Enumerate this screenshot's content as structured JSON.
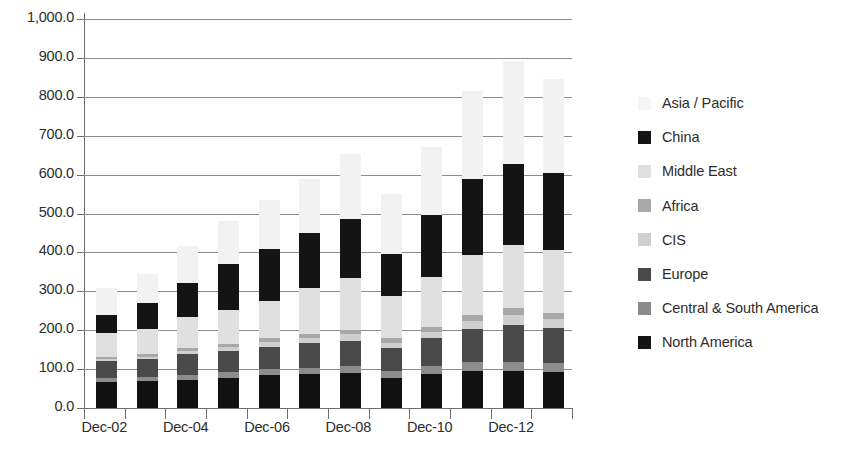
{
  "chart_data": {
    "type": "bar",
    "stacked": true,
    "title": "",
    "xlabel": "",
    "ylabel": "",
    "ylim": [
      0,
      1000
    ],
    "ytick_step": 100,
    "grid": true,
    "legend_position": "right",
    "categories": [
      "Dec-02",
      "Dec-03",
      "Dec-04",
      "Dec-05",
      "Dec-06",
      "Dec-07",
      "Dec-08",
      "Dec-09",
      "Dec-10",
      "Dec-11",
      "Dec-12",
      "Dec-13"
    ],
    "xtick_labels": [
      "Dec-02",
      "",
      "Dec-04",
      "",
      "Dec-06",
      "",
      "Dec-08",
      "",
      "Dec-10",
      "",
      "Dec-12",
      ""
    ],
    "series": [
      {
        "name": "North America",
        "color": "#111111",
        "values": [
          68,
          70,
          72,
          78,
          85,
          88,
          90,
          78,
          88,
          95,
          95,
          92
        ]
      },
      {
        "name": "Central & South America",
        "color": "#8c8c8c",
        "values": [
          8,
          10,
          12,
          14,
          15,
          16,
          18,
          18,
          20,
          22,
          24,
          24
        ]
      },
      {
        "name": "Europe",
        "color": "#4a4a4a",
        "values": [
          44,
          46,
          55,
          55,
          57,
          62,
          65,
          58,
          72,
          85,
          95,
          90
        ]
      },
      {
        "name": "CIS",
        "color": "#cfcfcf",
        "values": [
          6,
          6,
          8,
          9,
          12,
          14,
          16,
          14,
          16,
          22,
          26,
          24
        ]
      },
      {
        "name": "Africa",
        "color": "#a8a8a8",
        "values": [
          6,
          6,
          8,
          9,
          10,
          11,
          12,
          11,
          13,
          14,
          16,
          15
        ]
      },
      {
        "name": "Middle East",
        "color": "#e0e0e0",
        "values": [
          62,
          66,
          78,
          88,
          96,
          118,
          132,
          108,
          128,
          156,
          162,
          160
        ]
      },
      {
        "name": "China",
        "color": "#141414",
        "values": [
          46,
          66,
          88,
          118,
          135,
          140,
          152,
          108,
          158,
          195,
          210,
          198
        ]
      },
      {
        "name": "Asia / Pacific",
        "color": "#f2f2f2",
        "values": [
          68,
          75,
          95,
          110,
          125,
          140,
          167,
          155,
          175,
          225,
          265,
          242
        ]
      }
    ],
    "totals": [
      308,
      345,
      416,
      481,
      535,
      589,
      652,
      550,
      670,
      814,
      893,
      845
    ]
  },
  "legend": {
    "entries": [
      {
        "label": "Asia / Pacific",
        "color": "#f2f2f2"
      },
      {
        "label": "China",
        "color": "#141414"
      },
      {
        "label": "Middle East",
        "color": "#e0e0e0"
      },
      {
        "label": "Africa",
        "color": "#a8a8a8"
      },
      {
        "label": "CIS",
        "color": "#cfcfcf"
      },
      {
        "label": "Europe",
        "color": "#4a4a4a"
      },
      {
        "label": "Central & South America",
        "color": "#8c8c8c"
      },
      {
        "label": "North America",
        "color": "#141414"
      }
    ]
  },
  "axes": {
    "y_tick_labels": [
      "1,000.0",
      "900.0",
      "800.0",
      "700.0",
      "600.0",
      "500.0",
      "400.0",
      "300.0",
      "200.0",
      "100.0",
      "0.0"
    ],
    "x_tick_labels": [
      "Dec-02",
      "Dec-04",
      "Dec-06",
      "Dec-08",
      "Dec-10",
      "Dec-12"
    ]
  }
}
